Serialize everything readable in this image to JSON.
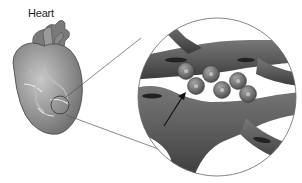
{
  "diagram": {
    "label_heart": "Heart",
    "colors": {
      "background": "#ffffff",
      "vessel": "#555555",
      "vessel_dark": "#3a3a3a",
      "heart": "#8a8a8a",
      "cell": "#6e6e6e",
      "outline": "#666666",
      "arrow": "#111111"
    },
    "magnifier": {
      "cx": 217,
      "cy": 97,
      "r": 79
    },
    "heart_focus": {
      "cx": 60,
      "cy": 105,
      "r": 9
    },
    "cells": [
      {
        "cx": 186,
        "cy": 71
      },
      {
        "cx": 196,
        "cy": 86
      },
      {
        "cx": 211,
        "cy": 74
      },
      {
        "cx": 222,
        "cy": 90
      },
      {
        "cx": 238,
        "cy": 81
      },
      {
        "cx": 248,
        "cy": 94
      }
    ]
  }
}
